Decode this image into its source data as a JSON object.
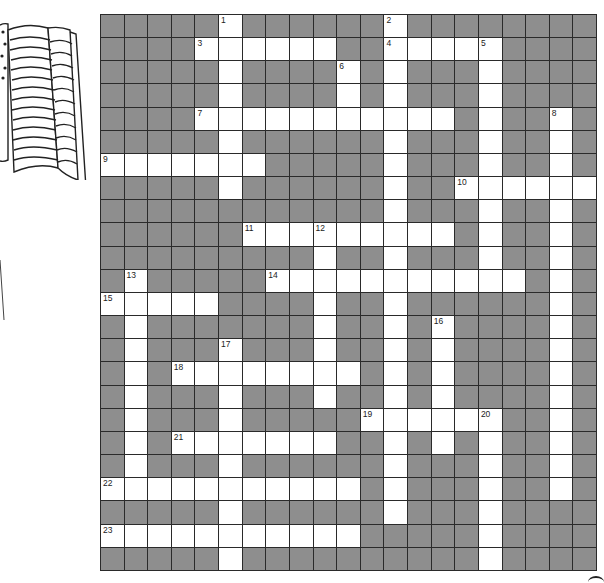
{
  "puzzle": {
    "type": "crossword",
    "rows": 24,
    "cols": 21,
    "colors": {
      "block": "#8e8e8e",
      "open": "#ffffff",
      "line": "#2a2a2a"
    },
    "white_cells": [
      [
        5,
        12
      ],
      [
        4,
        5,
        6,
        7,
        8,
        9,
        12,
        13,
        14,
        15,
        16
      ],
      [
        5,
        10,
        12,
        16
      ],
      [
        5,
        10,
        12,
        16
      ],
      [
        4,
        5,
        6,
        7,
        8,
        9,
        10,
        11,
        12,
        13,
        14,
        16,
        19
      ],
      [
        5,
        12,
        16,
        19
      ],
      [
        0,
        1,
        2,
        3,
        4,
        5,
        6,
        12,
        16,
        19
      ],
      [
        5,
        12,
        15,
        16,
        17,
        18,
        19,
        20
      ],
      [
        12,
        16,
        19
      ],
      [
        6,
        7,
        8,
        9,
        10,
        11,
        12,
        13,
        14,
        16,
        19
      ],
      [
        9,
        12,
        16,
        19
      ],
      [
        1,
        7,
        8,
        9,
        10,
        11,
        12,
        13,
        14,
        15,
        16,
        17,
        19
      ],
      [
        0,
        1,
        2,
        3,
        4,
        9,
        12,
        19
      ],
      [
        1,
        9,
        12,
        14,
        19
      ],
      [
        1,
        5,
        9,
        12,
        14,
        19
      ],
      [
        1,
        3,
        4,
        5,
        6,
        7,
        8,
        9,
        10,
        12,
        14,
        19
      ],
      [
        1,
        5,
        9,
        12,
        14,
        19
      ],
      [
        1,
        5,
        11,
        12,
        13,
        14,
        15,
        16,
        19
      ],
      [
        1,
        3,
        4,
        5,
        6,
        7,
        8,
        9,
        12,
        14,
        16,
        19
      ],
      [
        1,
        5,
        12,
        16,
        19
      ],
      [
        0,
        1,
        2,
        3,
        4,
        5,
        6,
        7,
        8,
        9,
        10,
        12,
        16,
        19
      ],
      [
        5,
        12,
        16
      ],
      [
        0,
        1,
        2,
        3,
        4,
        5,
        6,
        7,
        8,
        9,
        10,
        16
      ],
      [
        5,
        16
      ]
    ],
    "numbers": [
      {
        "n": "1",
        "r": 0,
        "c": 5
      },
      {
        "n": "2",
        "r": 0,
        "c": 12
      },
      {
        "n": "3",
        "r": 1,
        "c": 4
      },
      {
        "n": "4",
        "r": 1,
        "c": 12
      },
      {
        "n": "5",
        "r": 1,
        "c": 16
      },
      {
        "n": "6",
        "r": 2,
        "c": 10
      },
      {
        "n": "7",
        "r": 4,
        "c": 4
      },
      {
        "n": "8",
        "r": 4,
        "c": 19
      },
      {
        "n": "9",
        "r": 6,
        "c": 0
      },
      {
        "n": "10",
        "r": 7,
        "c": 15
      },
      {
        "n": "11",
        "r": 9,
        "c": 6
      },
      {
        "n": "12",
        "r": 9,
        "c": 9
      },
      {
        "n": "13",
        "r": 11,
        "c": 1
      },
      {
        "n": "14",
        "r": 11,
        "c": 7
      },
      {
        "n": "15",
        "r": 12,
        "c": 0
      },
      {
        "n": "16",
        "r": 13,
        "c": 14
      },
      {
        "n": "17",
        "r": 14,
        "c": 5
      },
      {
        "n": "18",
        "r": 15,
        "c": 3
      },
      {
        "n": "19",
        "r": 17,
        "c": 11
      },
      {
        "n": "20",
        "r": 17,
        "c": 16
      },
      {
        "n": "21",
        "r": 18,
        "c": 3
      },
      {
        "n": "22",
        "r": 20,
        "c": 0
      },
      {
        "n": "23",
        "r": 22,
        "c": 0
      }
    ]
  },
  "decoration": {
    "icon": "american-flag-icon"
  }
}
